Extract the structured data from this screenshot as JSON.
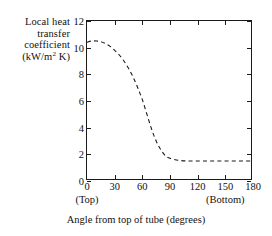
{
  "chart_data": {
    "type": "line",
    "title": "",
    "xlabel": "Angle from top of tube (degrees)",
    "ylabel_lines": [
      "Local heat",
      "transfer",
      "coefficient",
      "(kW/m",
      " K)"
    ],
    "ylabel_unit_prefix": "(kW/m",
    "ylabel_unit_exponent": "2",
    "ylabel_unit_suffix": " K)",
    "ylabel_full": "Local heat transfer coefficient (kW/m2 K)",
    "xlim": [
      0,
      180
    ],
    "ylim": [
      0,
      12
    ],
    "xticks": [
      0,
      30,
      60,
      90,
      120,
      150,
      180
    ],
    "xtick_labels": [
      "0",
      "30",
      "60",
      "90",
      "120",
      "150",
      "180"
    ],
    "yticks": [
      0,
      2,
      4,
      6,
      8,
      10,
      12
    ],
    "ytick_labels": [
      "0",
      "2",
      "4",
      "6",
      "8",
      "10",
      "12"
    ],
    "grid": false,
    "legend": false,
    "linestyle": "dashed",
    "linecolor": "#1a1a1a",
    "annotations": [
      {
        "text": "(Top)",
        "x": 0
      },
      {
        "text": "(Bottom)",
        "x": 150
      }
    ],
    "series": [
      {
        "name": "Local heat transfer coefficient",
        "x": [
          0,
          5,
          10,
          15,
          20,
          25,
          30,
          35,
          40,
          45,
          50,
          55,
          60,
          65,
          70,
          75,
          80,
          85,
          90,
          100,
          110,
          120,
          130,
          140,
          150,
          160,
          170,
          180
        ],
        "values": [
          10.4,
          10.5,
          10.5,
          10.45,
          10.3,
          10.1,
          9.8,
          9.45,
          9.0,
          8.45,
          7.8,
          7.0,
          6.1,
          5.0,
          3.9,
          3.0,
          2.35,
          1.9,
          1.7,
          1.55,
          1.5,
          1.5,
          1.5,
          1.5,
          1.5,
          1.5,
          1.5,
          1.5
        ]
      }
    ]
  },
  "axes": {
    "x_annotation_top": "(Top)",
    "x_annotation_bottom": "(Bottom)"
  }
}
